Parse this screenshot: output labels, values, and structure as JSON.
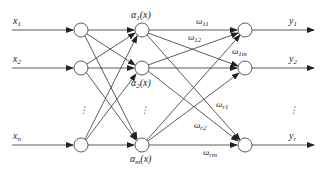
{
  "diagram": {
    "type": "neural-network",
    "colors": {
      "line": "#333333",
      "node_fill": "#ffffff",
      "text": "#222222"
    },
    "inputs": [
      {
        "label": "x",
        "sub": "1"
      },
      {
        "label": "x",
        "sub": "2"
      },
      {
        "label": "x",
        "sub": "n"
      }
    ],
    "hidden": [
      {
        "label": "α",
        "sub": "1",
        "arg": "(x)"
      },
      {
        "label": "α",
        "sub": "2",
        "arg": "(x)"
      },
      {
        "label": "α",
        "sub": "m",
        "arg": "(x)"
      }
    ],
    "outputs": [
      {
        "label": "y",
        "sub": "1"
      },
      {
        "label": "y",
        "sub": "2"
      },
      {
        "label": "y",
        "sub": "r"
      }
    ],
    "weights": [
      {
        "label": "ω",
        "sub": "11"
      },
      {
        "label": "ω",
        "sub": "12"
      },
      {
        "label": "ω",
        "sub": "1m"
      },
      {
        "label": "ω",
        "sub": "r1"
      },
      {
        "label": "ω",
        "sub": "r2"
      },
      {
        "label": "ω",
        "sub": "rm"
      }
    ],
    "ellipsis": "⋮"
  }
}
